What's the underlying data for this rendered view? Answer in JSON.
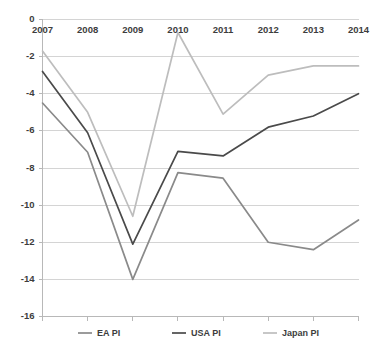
{
  "chart_data": {
    "type": "line",
    "title": "",
    "subtitle": "",
    "xlabel": "",
    "ylabel": "",
    "categories": [
      "2007",
      "2008",
      "2009",
      "2010",
      "2011",
      "2012",
      "2013",
      "2014"
    ],
    "x": [
      2007,
      2008,
      2009,
      2010,
      2011,
      2012,
      2013,
      2014
    ],
    "ylim": [
      -16,
      0
    ],
    "xlim": [
      2007,
      2014
    ],
    "y_ticks": [
      0,
      -2,
      -4,
      -6,
      -8,
      -10,
      -12,
      -14,
      -16
    ],
    "y_tick_labels": [
      "0",
      "-2",
      "-4",
      "-6",
      "-8",
      "-10",
      "-12",
      "-14",
      "-16"
    ],
    "grid": true,
    "grid_axis": "y",
    "legend_position": "bottom",
    "x_axis_labels_position": "top-inside-plot",
    "series": [
      {
        "name": "EA PI",
        "color": "#8a8a8a",
        "values": [
          -4.5,
          -7.15,
          -14.0,
          -8.25,
          -8.55,
          -12.0,
          -12.4,
          -10.8
        ]
      },
      {
        "name": "USA PI",
        "color": "#4a4a4a",
        "values": [
          -2.8,
          -6.1,
          -12.1,
          -7.1,
          -7.35,
          -5.8,
          -5.2,
          -4.0
        ]
      },
      {
        "name": "Japan PI",
        "color": "#bdbdbd",
        "values": [
          -1.7,
          -5.0,
          -10.6,
          -0.7,
          -5.1,
          -3.0,
          -2.5,
          -2.5
        ]
      }
    ]
  },
  "legend": {
    "items": [
      {
        "label": "EA PI",
        "color": "#8a8a8a"
      },
      {
        "label": "USA PI",
        "color": "#4a4a4a"
      },
      {
        "label": "Japan PI",
        "color": "#bdbdbd"
      }
    ]
  },
  "colors": {
    "background": "#ffffff",
    "gridline": "#d4d4d4",
    "axis": "#b8b8b8",
    "text": "#3d3d3d",
    "ea_pi": "#8a8a8a",
    "usa_pi": "#4a4a4a",
    "japan_pi": "#bdbdbd"
  }
}
